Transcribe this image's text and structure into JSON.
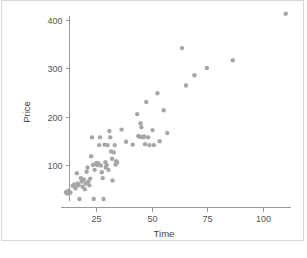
{
  "chart_data": {
    "type": "scatter",
    "title": "",
    "xlabel": "Time",
    "ylabel": "Price",
    "xlim": [
      8,
      114
    ],
    "ylim": [
      20,
      430
    ],
    "grid": false,
    "legend": "none",
    "xticks": [
      25,
      50,
      75,
      100
    ],
    "yticks": [
      100,
      200,
      300,
      400
    ],
    "xtick_labels": [
      "25",
      "50",
      "75",
      "100"
    ],
    "ytick_labels": [
      "100",
      "200",
      "300",
      "400"
    ],
    "marker_color": "#a6a6a6",
    "marker_size": 2.2,
    "axis_color": "#9a9a9a",
    "background_color": "#ffffff",
    "frame_color": "#d8d8d8",
    "n_points": 80,
    "points": [
      [
        11.5,
        44
      ],
      [
        12.0,
        41
      ],
      [
        12.6,
        47
      ],
      [
        13.5,
        43
      ],
      [
        14.5,
        57
      ],
      [
        15.2,
        60
      ],
      [
        15.8,
        52
      ],
      [
        16.4,
        83
      ],
      [
        16.8,
        62
      ],
      [
        17.2,
        58
      ],
      [
        17.6,
        30
      ],
      [
        18.2,
        73
      ],
      [
        18.6,
        66
      ],
      [
        19.0,
        55
      ],
      [
        19.5,
        70
      ],
      [
        20.0,
        50
      ],
      [
        20.4,
        62
      ],
      [
        20.8,
        86
      ],
      [
        21.2,
        95
      ],
      [
        21.6,
        66
      ],
      [
        22.0,
        58
      ],
      [
        22.4,
        72
      ],
      [
        22.8,
        118
      ],
      [
        23.2,
        157
      ],
      [
        23.6,
        100
      ],
      [
        24.0,
        30
      ],
      [
        24.4,
        90
      ],
      [
        24.8,
        102
      ],
      [
        25.2,
        104
      ],
      [
        25.6,
        100
      ],
      [
        26.0,
        103
      ],
      [
        26.4,
        141
      ],
      [
        26.8,
        157
      ],
      [
        27.2,
        99
      ],
      [
        27.6,
        85
      ],
      [
        28.0,
        73
      ],
      [
        28.4,
        30
      ],
      [
        28.8,
        142
      ],
      [
        29.2,
        106
      ],
      [
        29.4,
        95
      ],
      [
        29.8,
        100
      ],
      [
        30.2,
        141
      ],
      [
        30.6,
        90
      ],
      [
        31.0,
        170
      ],
      [
        31.4,
        157
      ],
      [
        31.8,
        128
      ],
      [
        32.2,
        113
      ],
      [
        32.4,
        68
      ],
      [
        33.0,
        126
      ],
      [
        33.4,
        141
      ],
      [
        34.0,
        108
      ],
      [
        34.5,
        105
      ],
      [
        36.5,
        173
      ],
      [
        38.5,
        148
      ],
      [
        41.5,
        142
      ],
      [
        43.5,
        205
      ],
      [
        44.0,
        160
      ],
      [
        44.6,
        158
      ],
      [
        45.0,
        186
      ],
      [
        45.4,
        178
      ],
      [
        45.8,
        158
      ],
      [
        46.2,
        157
      ],
      [
        46.6,
        159
      ],
      [
        47.0,
        143
      ],
      [
        47.6,
        230
      ],
      [
        48.4,
        157
      ],
      [
        49.0,
        141
      ],
      [
        50.4,
        172
      ],
      [
        51.0,
        141
      ],
      [
        52.6,
        248
      ],
      [
        53.6,
        149
      ],
      [
        55.4,
        213
      ],
      [
        57.0,
        166
      ],
      [
        63.6,
        341
      ],
      [
        65.4,
        264
      ],
      [
        69.2,
        285
      ],
      [
        74.8,
        300
      ],
      [
        86.4,
        316
      ],
      [
        110.2,
        412
      ],
      [
        33.8,
        101
      ]
    ]
  },
  "axes": {
    "y_title": "Price",
    "x_title": "Time"
  }
}
